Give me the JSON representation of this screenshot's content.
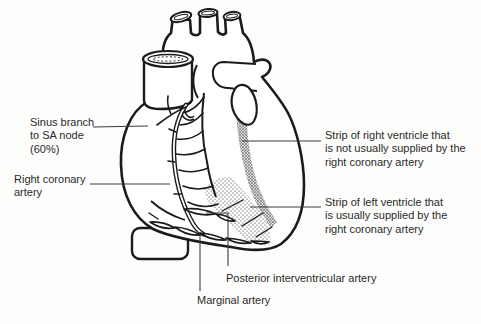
{
  "diagram": {
    "type": "anatomical-line-drawing",
    "labels": {
      "sinus_branch": "Sinus branch\nto SA node\n(60%)",
      "right_coronary": "Right coronary\nartery",
      "strip_right_ventricle": "Strip of right ventricle that\nis not usually supplied by the\nright coronary artery",
      "strip_left_ventricle": "Strip of left ventricle that\nis usually supplied by the\nright coronary artery",
      "posterior_interventricular": "Posterior interventricular artery",
      "marginal": "Marginal artery"
    },
    "colors": {
      "background": "#fdfdfb",
      "line": "#1b1b1b",
      "leader_line": "#3c3c3c",
      "text": "#2a2a2a",
      "shaded_strip": "#d8d8d8",
      "hatch_line": "#7d7d7d",
      "stipple_dot": "#2e2e2e"
    }
  }
}
